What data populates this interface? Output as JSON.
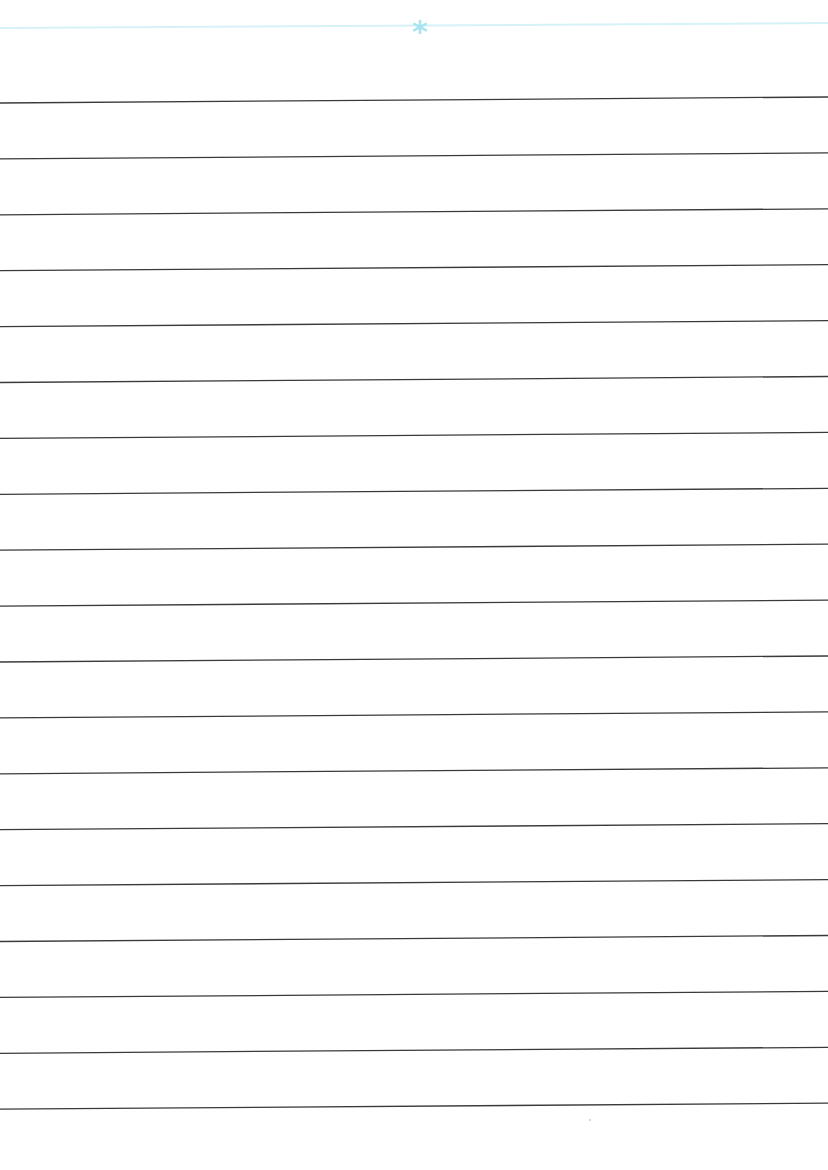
{
  "page": {
    "type": "lined-paper",
    "background": "#ffffff",
    "header_rule_color": "#d6f2f7",
    "asterisk_color": "#a8e4ef",
    "ruled_line_color": "#3a3a3a",
    "ruled_line_count": 19,
    "asterisk_glyph": "*"
  }
}
